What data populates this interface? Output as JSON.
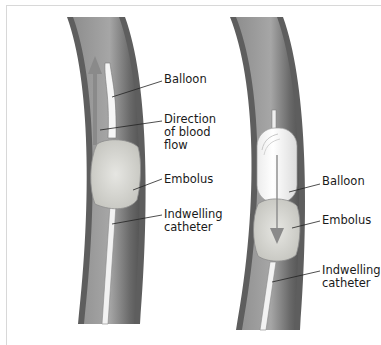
{
  "figure": {
    "panels": [
      {
        "id": "left",
        "labels": [
          {
            "text": "Balloon",
            "x": 164,
            "y": 51
          },
          {
            "text": "Direction of blood flow",
            "lines": [
              "Direction",
              "of blood",
              "flow"
            ],
            "x": 164,
            "y": 91
          },
          {
            "text": "Embolus",
            "x": 164,
            "y": 174
          },
          {
            "text": "Indwelling catheter",
            "lines": [
              "Indwelling",
              "catheter"
            ],
            "x": 164,
            "y": 209
          }
        ]
      },
      {
        "id": "right",
        "labels": [
          {
            "text": "Balloon",
            "x": 322,
            "y": 167
          },
          {
            "text": "Embolus",
            "x": 322,
            "y": 215
          },
          {
            "text": "Indwelling catheter",
            "lines": [
              "Indwelling",
              "catheter"
            ],
            "x": 322,
            "y": 265
          }
        ]
      }
    ],
    "colors": {
      "vessel_wall": "#6f6f6f",
      "vessel_lumen": "#9a9a9a",
      "embolus": "#d6d6d0",
      "balloon": "#fafafa",
      "arrow": "#8a8a8a"
    }
  }
}
